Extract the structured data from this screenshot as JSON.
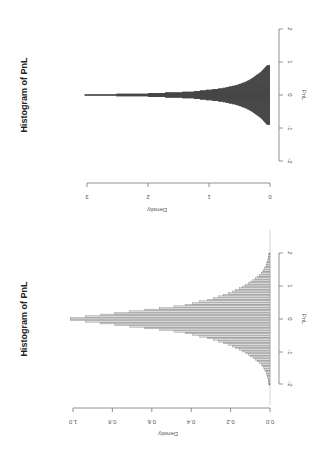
{
  "chart_data": [
    {
      "type": "bar",
      "orientation": "rotated-90-clockwise",
      "title": "Histogram of PnL",
      "xlabel": "PnL",
      "ylabel": "Density",
      "xlim": [
        -2,
        2
      ],
      "ylim": [
        0,
        3.3
      ],
      "x_ticks": [
        "-2",
        "-1",
        "0",
        "1",
        "2"
      ],
      "y_ticks": [
        "0",
        "1",
        "2",
        "3"
      ],
      "bar_color": "#111111",
      "grid": false,
      "x": [
        -0.9,
        -0.7,
        -0.5,
        -0.4,
        -0.3,
        -0.2,
        -0.1,
        -0.05,
        0.0,
        0.05,
        0.1,
        0.2,
        0.3,
        0.4,
        0.5,
        0.7,
        0.9
      ],
      "values": [
        0.05,
        0.15,
        0.3,
        0.4,
        0.55,
        0.8,
        1.3,
        2.0,
        3.3,
        2.0,
        1.3,
        0.8,
        0.55,
        0.4,
        0.3,
        0.15,
        0.05
      ]
    },
    {
      "type": "bar",
      "orientation": "rotated-90-clockwise",
      "title": "Histogram of PnL",
      "xlabel": "PnL",
      "ylabel": "Density",
      "xlim": [
        -2,
        2
      ],
      "ylim": [
        0,
        1.05
      ],
      "x_ticks": [
        "-2",
        "-1",
        "0",
        "1",
        "2"
      ],
      "y_ticks": [
        "0.0",
        "0.2",
        "0.4",
        "0.6",
        "0.8",
        "1.0"
      ],
      "bar_color": "#d9d9d9",
      "grid": false,
      "x": [
        -2.0,
        -1.8,
        -1.6,
        -1.4,
        -1.2,
        -1.0,
        -0.8,
        -0.6,
        -0.4,
        -0.2,
        0.0,
        0.2,
        0.4,
        0.6,
        0.8,
        1.0,
        1.2,
        1.4,
        1.6,
        1.8,
        2.0
      ],
      "values": [
        0.005,
        0.01,
        0.02,
        0.04,
        0.08,
        0.13,
        0.2,
        0.3,
        0.45,
        0.75,
        1.05,
        0.75,
        0.45,
        0.3,
        0.2,
        0.13,
        0.08,
        0.04,
        0.02,
        0.01,
        0.005
      ]
    }
  ]
}
